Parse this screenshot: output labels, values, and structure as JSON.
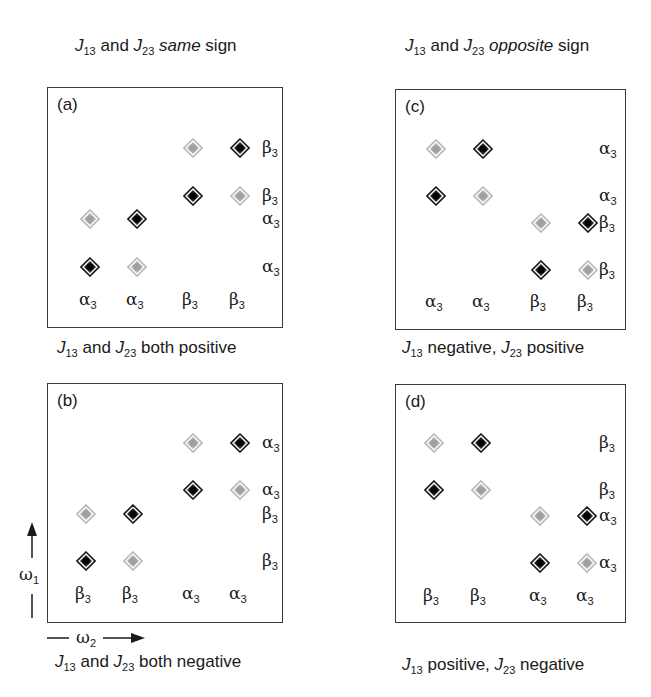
{
  "headers": {
    "left": {
      "j1": "J",
      "s1": "13",
      "mid": " and ",
      "j2": "J",
      "s2": "23",
      "emph": "same",
      "tail": " sign"
    },
    "right": {
      "j1": "J",
      "s1": "13",
      "mid": " and ",
      "j2": "J",
      "s2": "23",
      "emph": "opposite",
      "tail": " sign"
    }
  },
  "panels": {
    "a": {
      "tag": "(a)",
      "caption": {
        "j1": "J",
        "s1": "13",
        "mid": " and ",
        "j2": "J",
        "s2": "23",
        "tail": " both positive"
      },
      "bottom_labels": [
        "α",
        "α",
        "β",
        "β"
      ],
      "right_labels": [
        "β",
        "β",
        "α",
        "α"
      ]
    },
    "b": {
      "tag": "(b)",
      "caption": {
        "j1": "J",
        "s1": "13",
        "mid": " and ",
        "j2": "J",
        "s2": "23",
        "tail": " both negative"
      },
      "bottom_labels": [
        "β",
        "β",
        "α",
        "α"
      ],
      "right_labels": [
        "α",
        "α",
        "β",
        "β"
      ]
    },
    "c": {
      "tag": "(c)",
      "caption": {
        "j1": "J",
        "s1": "13",
        "mid": " negative, ",
        "j2": "J",
        "s2": "23",
        "tail": " positive"
      },
      "bottom_labels": [
        "α",
        "α",
        "β",
        "β"
      ],
      "right_labels": [
        "α",
        "α",
        "β",
        "β"
      ]
    },
    "d": {
      "tag": "(d)",
      "caption": {
        "j1": "J",
        "s1": "13",
        "mid": " positive, ",
        "j2": "J",
        "s2": "23",
        "tail": " negative"
      },
      "bottom_labels": [
        "β",
        "β",
        "α",
        "α"
      ],
      "right_labels": [
        "β",
        "β",
        "α",
        "α"
      ]
    }
  },
  "label_subscript": "3",
  "axes": {
    "omega1": {
      "sym": "ω",
      "sub": "1"
    },
    "omega2": {
      "sym": "ω",
      "sub": "2"
    }
  },
  "colors": {
    "dark_peak": "#111111",
    "light_peak": "#a8a8a8",
    "border": "#3a3a3a",
    "text": "#1a1a1a"
  },
  "chart_data": {
    "type": "scatter",
    "panels": [
      {
        "id": "a",
        "dark": [
          [
            1,
            1
          ],
          [
            2,
            2
          ],
          [
            3,
            3
          ],
          [
            4,
            4
          ]
        ],
        "light": [
          [
            2,
            1
          ],
          [
            1,
            2
          ],
          [
            4,
            3
          ],
          [
            3,
            4
          ]
        ],
        "x_labels": [
          "α3",
          "α3",
          "β3",
          "β3"
        ],
        "y_labels": [
          "α3",
          "α3",
          "β3",
          "β3"
        ]
      },
      {
        "id": "b",
        "dark": [
          [
            1,
            1
          ],
          [
            2,
            2
          ],
          [
            3,
            3
          ],
          [
            4,
            4
          ]
        ],
        "light": [
          [
            2,
            1
          ],
          [
            1,
            2
          ],
          [
            4,
            3
          ],
          [
            3,
            4
          ]
        ],
        "x_labels": [
          "β3",
          "β3",
          "α3",
          "α3"
        ],
        "y_labels": [
          "β3",
          "β3",
          "α3",
          "α3"
        ]
      },
      {
        "id": "c",
        "dark": [
          [
            3,
            1
          ],
          [
            4,
            2
          ],
          [
            1,
            3
          ],
          [
            2,
            4
          ]
        ],
        "light": [
          [
            4,
            1
          ],
          [
            3,
            2
          ],
          [
            2,
            3
          ],
          [
            1,
            4
          ]
        ],
        "x_labels": [
          "α3",
          "α3",
          "β3",
          "β3"
        ],
        "y_labels": [
          "β3",
          "β3",
          "α3",
          "α3"
        ]
      },
      {
        "id": "d",
        "dark": [
          [
            3,
            1
          ],
          [
            4,
            2
          ],
          [
            1,
            3
          ],
          [
            2,
            4
          ]
        ],
        "light": [
          [
            4,
            1
          ],
          [
            3,
            2
          ],
          [
            2,
            3
          ],
          [
            1,
            4
          ]
        ],
        "x_labels": [
          "β3",
          "β3",
          "α3",
          "α3"
        ],
        "y_labels": [
          "α3",
          "α3",
          "β3",
          "β3"
        ]
      }
    ],
    "xlabel": "ω2",
    "ylabel": "ω1"
  }
}
